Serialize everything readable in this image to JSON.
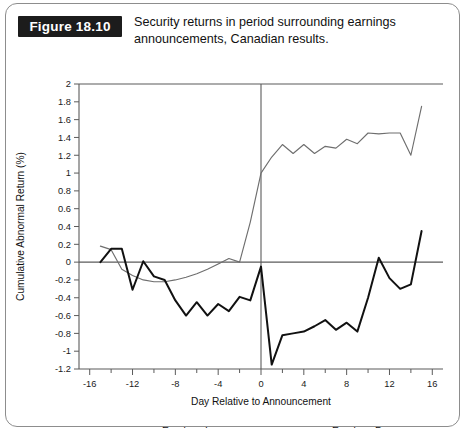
{
  "figure": {
    "label": "Figure 18.10",
    "caption_line1": "Security returns in period surrounding earnings",
    "caption_line2": "announcements, Canadian results."
  },
  "colors": {
    "increase_line": "#6e6e6e",
    "decrease_line": "#111111",
    "axis": "#5b5b5b",
    "label_box_bg": "#1c1c1c",
    "label_box_text": "#ffffff",
    "card_border": "#8d8d8d"
  },
  "chart_data": {
    "type": "line",
    "title": "Security returns in period surrounding earnings announcements, Canadian results.",
    "xlabel": "Day Relative to Announcement",
    "ylabel": "Cumulative Abnormal Return (%)",
    "xlim": [
      -17,
      17
    ],
    "ylim": [
      -1.2,
      2
    ],
    "grid": false,
    "legend_position": "bottom",
    "x_major_ticks": [
      -16,
      -12,
      -8,
      -4,
      0,
      4,
      8,
      12,
      16
    ],
    "x_minor_ticks": [
      -14,
      -10,
      -6,
      -2,
      2,
      6,
      10,
      14
    ],
    "x_tick_labels": [
      "-16",
      "-12",
      "-8",
      "-4",
      "0",
      "4",
      "8",
      "12",
      "16"
    ],
    "y_ticks": [
      -1.2,
      -1,
      -0.8,
      -0.6,
      -0.4,
      -0.2,
      0,
      0.2,
      0.4,
      0.6,
      0.8,
      1,
      1.2,
      1.4,
      1.6,
      1.8,
      2
    ],
    "y_tick_labels": [
      "-1.2",
      "-1",
      "-0.8",
      "-0.6",
      "-0.4",
      "-0.2",
      "0",
      "0.2",
      "0.4",
      "0.6",
      "0.8",
      "1",
      "1.2",
      "1.4",
      "1.6",
      "1.8",
      "2"
    ],
    "zero_reference_line_y": 0,
    "vertical_reference_line_x": 0,
    "x": [
      -15,
      -14,
      -13,
      -12,
      -11,
      -10,
      -9,
      -8,
      -7,
      -6,
      -5,
      -4,
      -3,
      -2,
      -1,
      0,
      1,
      2,
      3,
      4,
      5,
      6,
      7,
      8,
      9,
      10,
      11,
      12,
      13,
      14,
      15
    ],
    "series": [
      {
        "name": "Earnings Increases",
        "style": "thin-gray",
        "values": [
          0.18,
          0.14,
          -0.08,
          -0.15,
          -0.2,
          -0.22,
          -0.22,
          -0.2,
          -0.17,
          -0.13,
          -0.08,
          -0.02,
          0.04,
          0.0,
          0.45,
          1.0,
          1.18,
          1.32,
          1.22,
          1.32,
          1.22,
          1.3,
          1.28,
          1.38,
          1.33,
          1.45,
          1.44,
          1.45,
          1.45,
          1.2,
          1.75
        ]
      },
      {
        "name": "Earnings Decreases",
        "style": "thick-black",
        "values": [
          0.0,
          0.15,
          0.15,
          -0.31,
          0.01,
          -0.16,
          -0.2,
          -0.43,
          -0.6,
          -0.45,
          -0.6,
          -0.47,
          -0.55,
          -0.39,
          -0.43,
          -0.05,
          -1.15,
          -0.82,
          -0.8,
          -0.78,
          -0.72,
          -0.65,
          -0.76,
          -0.68,
          -0.78,
          -0.4,
          0.05,
          -0.18,
          -0.3,
          -0.25,
          0.35
        ]
      }
    ],
    "legend": [
      {
        "label": "Earnings Increases",
        "style": "thin-gray"
      },
      {
        "label": "Earnings Decreases",
        "style": "thick-black"
      }
    ]
  }
}
